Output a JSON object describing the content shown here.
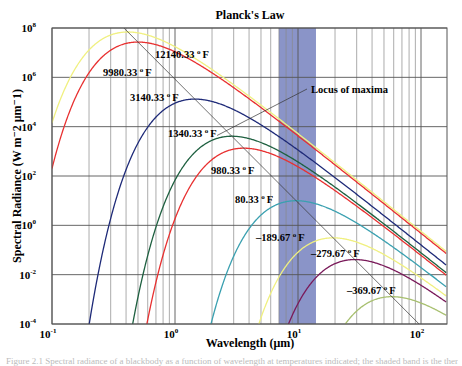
{
  "chart_data": {
    "type": "line",
    "title": "Planck's Law",
    "xlabel": "Wavelength (μm)",
    "ylabel": "Spectral Radiance (W m⁻2 μm⁻1)",
    "xscale": "log",
    "yscale": "log",
    "xlim": [
      0.1,
      160
    ],
    "ylim": [
      0.0001,
      100000000
    ],
    "x_ticks": [
      {
        "value": 0.1,
        "base": "10",
        "exp": "-1"
      },
      {
        "value": 1,
        "base": "10",
        "exp": "0"
      },
      {
        "value": 10,
        "base": "10",
        "exp": "1"
      },
      {
        "value": 100,
        "base": "10",
        "exp": "2"
      }
    ],
    "y_ticks": [
      {
        "value": 100000000,
        "base": "10",
        "exp": "8"
      },
      {
        "value": 1000000,
        "base": "10",
        "exp": "6"
      },
      {
        "value": 10000,
        "base": "10",
        "exp": "4"
      },
      {
        "value": 100,
        "base": "10",
        "exp": "2"
      },
      {
        "value": 1,
        "base": "10",
        "exp": "0"
      },
      {
        "value": 0.01,
        "base": "10",
        "exp": "-2"
      },
      {
        "value": 0.0001,
        "base": "10",
        "exp": "-4"
      }
    ],
    "grid": true,
    "highlight_band": {
      "x_from": 7,
      "x_to": 14,
      "color": "#8a94c8"
    },
    "series": [
      {
        "name": "12140.33 °F",
        "temp_F": 12140.33,
        "color": "#f0f080",
        "label": {
          "text": "12140.33",
          "x": 155,
          "y": 58
        }
      },
      {
        "name": "9980.33 °F",
        "temp_F": 9980.33,
        "color": "#e83030",
        "label": {
          "text": "9980.33",
          "x": 103,
          "y": 76
        }
      },
      {
        "name": "3140.33 °F",
        "temp_F": 3140.33,
        "color": "#1e2a78",
        "label": {
          "text": "3140.33",
          "x": 130,
          "y": 101
        }
      },
      {
        "name": "1340.33 °F",
        "temp_F": 1340.33,
        "color": "#1e6040",
        "label": {
          "text": "1340.33",
          "x": 168,
          "y": 137
        }
      },
      {
        "name": "980.33 °F",
        "temp_F": 980.33,
        "color": "#e83030",
        "label": {
          "text": "980.33",
          "x": 211,
          "y": 174
        }
      },
      {
        "name": "80.33 °F",
        "temp_F": 80.33,
        "color": "#3aa0b0",
        "label": {
          "text": "80.33",
          "x": 235,
          "y": 203
        }
      },
      {
        "name": "-189.67 °F",
        "temp_F": -189.67,
        "color": "#f0f080",
        "label": {
          "text": "–189.67",
          "x": 256,
          "y": 241
        }
      },
      {
        "name": "-279.67 °F",
        "temp_F": -279.67,
        "color": "#7a1a5a",
        "label": {
          "text": "–279.67",
          "x": 311,
          "y": 257
        }
      },
      {
        "name": "-369.67 °F",
        "temp_F": -369.67,
        "color": "#a8c070",
        "label": {
          "text": "–369.67",
          "x": 347,
          "y": 294
        }
      }
    ],
    "annotations": [
      {
        "text": "Locus of maxima",
        "x": 311,
        "y": 93
      }
    ],
    "degree_unit": "F"
  },
  "caption": "Figure 2.1  Spectral radiance of a blackbody as a function of wavelength at temperatures indicated; the shaded band is the thermal infrared window."
}
